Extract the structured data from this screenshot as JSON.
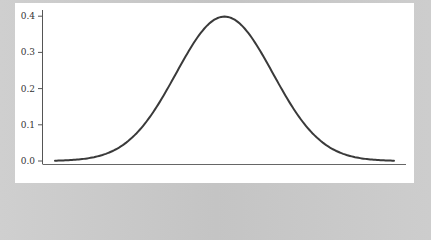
{
  "chart_data": {
    "type": "line",
    "title": "",
    "xlabel": "",
    "ylabel": "",
    "ylim": [
      0.0,
      0.4
    ],
    "xlim": [
      -3.5,
      3.5
    ],
    "yticks": [
      "0.0",
      "0.1",
      "0.2",
      "0.3",
      "0.4"
    ],
    "xticks": [],
    "grid": false,
    "legend": null,
    "series": [
      {
        "name": "standard normal pdf",
        "color": "#3a3a3a",
        "x": [
          -3.5,
          -3.0,
          -2.5,
          -2.0,
          -1.5,
          -1.0,
          -0.5,
          0.0,
          0.5,
          1.0,
          1.5,
          2.0,
          2.5,
          3.0,
          3.5
        ],
        "values": [
          0.001,
          0.004,
          0.018,
          0.054,
          0.13,
          0.242,
          0.352,
          0.399,
          0.352,
          0.242,
          0.13,
          0.054,
          0.018,
          0.004,
          0.001
        ]
      }
    ]
  },
  "axis": {
    "y_tick_labels": [
      "0.0",
      "0.1",
      "0.2",
      "0.3",
      "0.4"
    ]
  },
  "colors": {
    "line": "#3a3a3a",
    "axis": "#555555",
    "panel": "#ffffff",
    "background": "#c9c9c9"
  }
}
